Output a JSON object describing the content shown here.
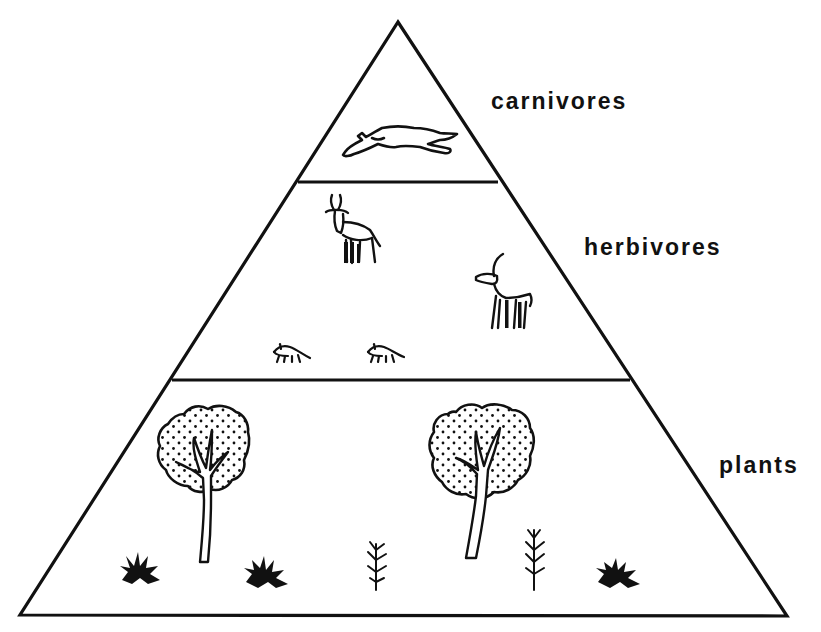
{
  "diagram": {
    "type": "ecological-pyramid",
    "colors": {
      "line": "#111111",
      "background": "#ffffff"
    },
    "levels": [
      {
        "id": "carnivores",
        "label": "carnivores",
        "position": "top",
        "illustrations": [
          "leaping cat (cheetah)"
        ]
      },
      {
        "id": "herbivores",
        "label": "herbivores",
        "position": "middle",
        "illustrations": [
          "antelope",
          "gazelle",
          "small rodent",
          "small rodent"
        ]
      },
      {
        "id": "plants",
        "label": "plants",
        "position": "bottom",
        "illustrations": [
          "tree",
          "tree",
          "grass tuft",
          "grass tuft",
          "grass tuft",
          "seedling",
          "seedling"
        ]
      }
    ]
  }
}
